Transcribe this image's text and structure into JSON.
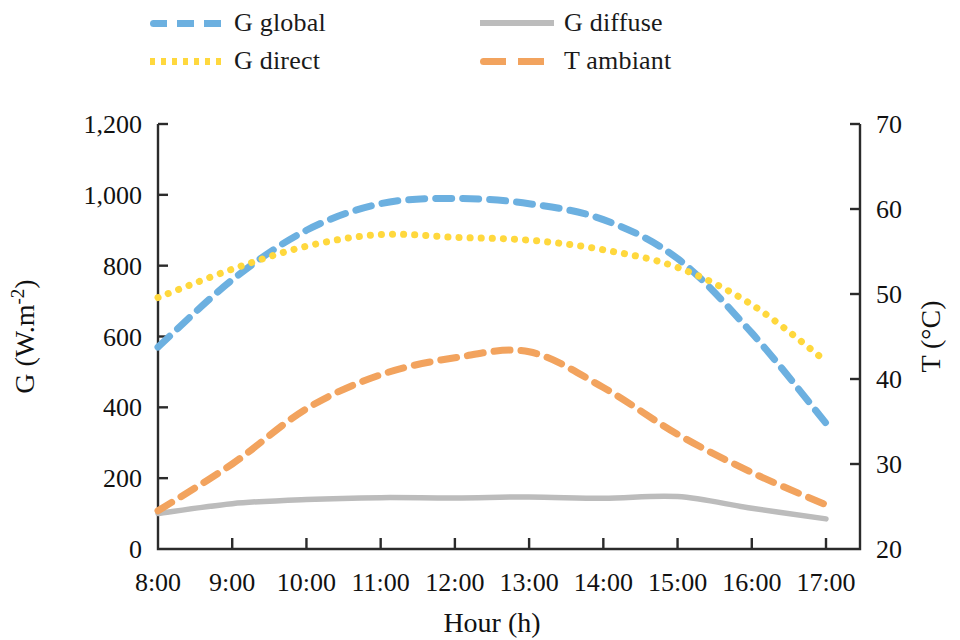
{
  "chart_data": {
    "type": "line",
    "title": "",
    "xlabel": "Hour (h)",
    "ylabel": "G (W.m-2)",
    "ylabel_base": "G (W.m",
    "ylabel_sup": "-2",
    "ylabel_tail": ")",
    "y2label": "T (°C)",
    "x": [
      "8:00",
      "9:00",
      "10:00",
      "11:00",
      "12:00",
      "13:00",
      "14:00",
      "15:00",
      "16:00",
      "17:00"
    ],
    "xtick_labels": [
      "8:00",
      "9:00",
      "10:00",
      "11:00",
      "12:00",
      "13:00",
      "14:00",
      "15:00",
      "16:00",
      "17:00"
    ],
    "ytick_labels": [
      "0",
      "200",
      "400",
      "600",
      "800",
      "1,000",
      "1,200"
    ],
    "ytick_values": [
      0,
      200,
      400,
      600,
      800,
      1000,
      1200
    ],
    "ylim": [
      0,
      1200
    ],
    "y2tick_labels": [
      "20",
      "30",
      "40",
      "50",
      "60",
      "70"
    ],
    "y2tick_values": [
      20,
      30,
      40,
      50,
      60,
      70
    ],
    "y2lim": [
      20,
      70
    ],
    "grid": false,
    "legend_position": "top",
    "series": [
      {
        "name": "G global",
        "axis": "left",
        "color": "#6cb0e0",
        "style": "dashed",
        "unit": "W.m-2",
        "values": [
          570,
          760,
          900,
          975,
          990,
          975,
          930,
          820,
          610,
          355
        ]
      },
      {
        "name": "G direct",
        "axis": "left",
        "color": "#ffd83d",
        "style": "dotted",
        "unit": "W.m-2",
        "values": [
          710,
          790,
          855,
          888,
          880,
          872,
          845,
          795,
          690,
          530
        ]
      },
      {
        "name": "G diffuse",
        "axis": "left",
        "color": "#bcbcbc",
        "style": "solid",
        "unit": "W.m-2",
        "values": [
          100,
          128,
          140,
          145,
          144,
          147,
          143,
          148,
          115,
          85
        ]
      },
      {
        "name": "T ambiant",
        "axis": "right",
        "color": "#f2a35e",
        "style": "dashed",
        "unit": "°C",
        "values": [
          24.5,
          30.0,
          36.5,
          40.5,
          42.5,
          43.2,
          39.0,
          33.5,
          29.0,
          25.2
        ]
      }
    ]
  },
  "legend": {
    "items": [
      {
        "label": "G global",
        "swatch": "dashed-blue-swatch"
      },
      {
        "label": "G diffuse",
        "swatch": "solid-gray-swatch"
      },
      {
        "label": "G direct",
        "swatch": "dotted-yellow-swatch"
      },
      {
        "label": "T ambiant",
        "swatch": "dashed-orange-swatch"
      }
    ]
  }
}
